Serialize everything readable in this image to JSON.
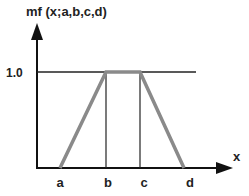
{
  "diagram": {
    "title": "mf (x;a,b,c,d)",
    "y_tick_label": "1.0",
    "x_axis_label": "x",
    "x_points": [
      {
        "label": "a",
        "x": 60
      },
      {
        "label": "b",
        "x": 106
      },
      {
        "label": "c",
        "x": 140
      },
      {
        "label": "d",
        "x": 184
      }
    ],
    "shape": "trapezoid",
    "colors": {
      "axis": "#111111",
      "membership_line": "#8a8a8a",
      "reference_lines": "#222222"
    }
  }
}
